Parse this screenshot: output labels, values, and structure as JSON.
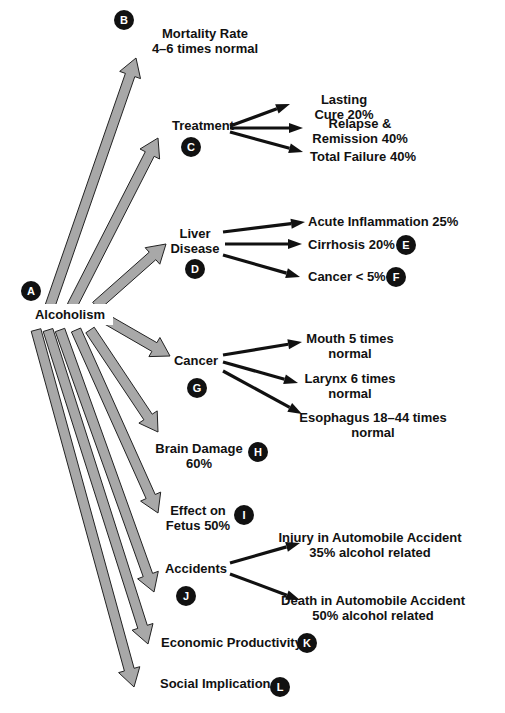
{
  "title": "Alcoholism",
  "root": {
    "label": "Alcoholism",
    "badge": "A"
  },
  "branches": [
    {
      "id": "mortality",
      "lines": [
        "Mortality Rate",
        "4–6 times normal"
      ],
      "badge": "B",
      "children": []
    },
    {
      "id": "treatment",
      "lines": [
        "Treatment"
      ],
      "badge": "C",
      "children": [
        {
          "lines": [
            "Lasting",
            "Cure 20%"
          ],
          "badge": ""
        },
        {
          "lines": [
            "Relapse &",
            "Remission 40%"
          ],
          "badge": ""
        },
        {
          "lines": [
            "Total Failure 40%"
          ],
          "badge": ""
        }
      ]
    },
    {
      "id": "liver",
      "lines": [
        "Liver",
        "Disease"
      ],
      "badge": "D",
      "children": [
        {
          "lines": [
            "Acute Inflammation 25%"
          ],
          "badge": ""
        },
        {
          "lines": [
            "Cirrhosis 20%"
          ],
          "badge": "E"
        },
        {
          "lines": [
            "Cancer  < 5%"
          ],
          "badge": "F"
        }
      ]
    },
    {
      "id": "cancer",
      "lines": [
        "Cancer"
      ],
      "badge": "G",
      "children": [
        {
          "lines": [
            "Mouth 5 times",
            "normal"
          ],
          "badge": ""
        },
        {
          "lines": [
            "Larynx 6 times",
            "normal"
          ],
          "badge": ""
        },
        {
          "lines": [
            "Esophagus 18–44 times",
            "normal"
          ],
          "badge": ""
        }
      ]
    },
    {
      "id": "brain",
      "lines": [
        "Brain Damage",
        "60%"
      ],
      "badge": "H",
      "children": []
    },
    {
      "id": "fetus",
      "lines": [
        "Effect on",
        "Fetus 50%"
      ],
      "badge": "I",
      "children": []
    },
    {
      "id": "accidents",
      "lines": [
        "Accidents"
      ],
      "badge": "J",
      "children": [
        {
          "lines": [
            "Injury in Automobile Accident",
            "35% alcohol related"
          ],
          "badge": ""
        },
        {
          "lines": [
            "Death in Automobile Accident",
            "50% alcohol related"
          ],
          "badge": ""
        }
      ]
    },
    {
      "id": "economic",
      "lines": [
        "Economic Productivity"
      ],
      "badge": "K",
      "children": []
    },
    {
      "id": "social",
      "lines": [
        "Social Implication"
      ],
      "badge": "L",
      "children": []
    }
  ],
  "colors": {
    "arrow_fill": "#a8a8a8",
    "badge_fill": "#111111",
    "text": "#111111"
  }
}
